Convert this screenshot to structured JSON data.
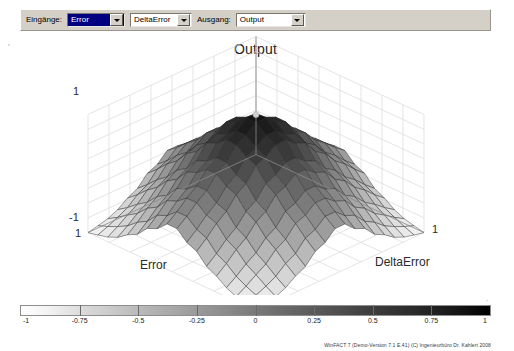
{
  "window": {
    "title": "Output"
  },
  "toolbar": {
    "inputs_label": "Eingänge:",
    "output_label": "Ausgang:",
    "input1": {
      "value": "Error",
      "selected": true,
      "arrow_icon": "chevron-down-icon"
    },
    "input2": {
      "value": "DeltaError",
      "selected": false,
      "arrow_icon": "chevron-down-icon"
    },
    "output": {
      "value": "Output",
      "selected": false,
      "arrow_icon": "chevron-down-icon"
    }
  },
  "plot": {
    "title": "Output",
    "z_max_label": "1",
    "z_min_label": "-1",
    "x_near_label": "1",
    "x_far_label": "1",
    "x_axis_name": "Error",
    "y_axis_name": "DeltaError"
  },
  "colorbar": {
    "min": -1,
    "max": 1,
    "ticks": [
      "-1",
      "-0.75",
      "-0.5",
      "-0.25",
      "0",
      "0.25",
      "0.5",
      "0.75",
      "1"
    ],
    "low_color": "#ffffff",
    "high_color": "#000000"
  },
  "footer": {
    "text": "WinFACT 7 (Demo-Version 7.1 E.41) (C) Ingenieurbüro Dr. Kahlert 2008"
  },
  "chart_data": {
    "type": "heatmap",
    "title": "Output",
    "xlabel": "Error",
    "ylabel": "DeltaError",
    "zlabel": "Output",
    "xlim": [
      -1,
      1
    ],
    "ylim": [
      -1,
      1
    ],
    "zlim": [
      -1,
      1
    ],
    "grid": true,
    "legend": "colorbar-bottom",
    "x": [
      -1,
      -0.75,
      -0.5,
      -0.25,
      0,
      0.25,
      0.5,
      0.75,
      1
    ],
    "y": [
      -1,
      -0.75,
      -0.5,
      -0.25,
      0,
      0.25,
      0.5,
      0.75,
      1
    ],
    "z": [
      [
        -1.0,
        -0.92,
        -0.72,
        -0.44,
        -0.2,
        -0.44,
        -0.72,
        -0.92,
        -1.0
      ],
      [
        -0.92,
        -0.7,
        -0.42,
        -0.12,
        0.08,
        -0.12,
        -0.42,
        -0.7,
        -0.92
      ],
      [
        -0.72,
        -0.42,
        -0.1,
        0.22,
        0.42,
        0.22,
        -0.1,
        -0.42,
        -0.72
      ],
      [
        -0.44,
        -0.12,
        0.22,
        0.58,
        0.78,
        0.58,
        0.22,
        -0.12,
        -0.44
      ],
      [
        -0.2,
        0.08,
        0.42,
        0.78,
        1.0,
        0.78,
        0.42,
        0.08,
        -0.2
      ],
      [
        -0.44,
        -0.12,
        0.22,
        0.58,
        0.78,
        0.58,
        0.22,
        -0.12,
        -0.44
      ],
      [
        -0.72,
        -0.42,
        -0.1,
        0.22,
        0.42,
        0.22,
        -0.1,
        -0.42,
        -0.72
      ],
      [
        -0.92,
        -0.7,
        -0.42,
        -0.12,
        0.08,
        -0.12,
        -0.42,
        -0.7,
        -0.92
      ],
      [
        -1.0,
        -0.92,
        -0.72,
        -0.44,
        -0.2,
        -0.44,
        -0.72,
        -0.92,
        -1.0
      ]
    ]
  }
}
